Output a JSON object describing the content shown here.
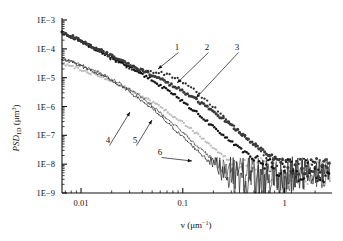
{
  "figure": {
    "background_color": "#ffffff",
    "plot_type": "log-log scatter/line power spectral density"
  },
  "axes": {
    "x": {
      "label_main": "v",
      "label_units": "(μm",
      "label_exponent": "−1",
      "label_close": ")",
      "label_full": "v (μm⁻¹)",
      "scale": "log",
      "range": [
        0.0065,
        2.8
      ],
      "tick_values": [
        0.01,
        0.1,
        1
      ],
      "tick_labels": [
        "0.01",
        "0.1",
        "1"
      ],
      "minor_ticks": true
    },
    "y": {
      "label_prefix": "PSD",
      "label_subscript": "1D",
      "label_units": "(μm",
      "label_exponent": "3",
      "label_close": ")",
      "label_full": "PSD₁ᴅ (μm³)",
      "scale": "log",
      "range": [
        1e-09,
        0.001
      ],
      "tick_values": [
        0.001,
        0.0001,
        1e-05,
        1e-06,
        1e-07,
        1e-08,
        1e-09
      ],
      "tick_labels": [
        "1E−3",
        "1E−4",
        "1E−5",
        "1E−6",
        "1E−7",
        "1E−8",
        "1E−9"
      ],
      "minor_ticks": true
    }
  },
  "annotations": [
    {
      "text": "1",
      "x": 177,
      "y": 50,
      "leader_to_x": 158,
      "leader_to_y": 69
    },
    {
      "text": "2",
      "x": 207,
      "y": 50,
      "leader_to_x": 177,
      "leader_to_y": 83
    },
    {
      "text": "3",
      "x": 237,
      "y": 50,
      "leader_to_x": 196,
      "leader_to_y": 98
    },
    {
      "text": "4",
      "x": 108,
      "y": 143,
      "leader_to_x": 130,
      "leader_to_y": 112
    },
    {
      "text": "5",
      "x": 135,
      "y": 143,
      "leader_to_x": 152,
      "leader_to_y": 120
    },
    {
      "text": "6",
      "x": 160,
      "y": 155,
      "leader_to_x": 192,
      "leader_to_y": 161
    }
  ],
  "chart_data": {
    "type": "line",
    "title": "",
    "xlabel": "v (μm⁻¹)",
    "ylabel": "PSD₁ᴅ (μm³)",
    "xscale": "log",
    "yscale": "log",
    "xlim": [
      0.0065,
      2.8
    ],
    "ylim": [
      1e-09,
      0.001
    ],
    "grid": false,
    "legend": "inline numeric callouts 1-6",
    "series": [
      {
        "name": "3",
        "label": "3",
        "color": "#3a3a3a",
        "style": "dense-dots-thick",
        "marker_size": 1.6,
        "x": [
          0.0068,
          0.009,
          0.012,
          0.016,
          0.021,
          0.028,
          0.037,
          0.05,
          0.066,
          0.088,
          0.117,
          0.155,
          0.206,
          0.274,
          0.364,
          0.484,
          0.643,
          0.855,
          1.14,
          1.51,
          2.0,
          2.4
        ],
        "y": [
          0.00036,
          0.00023,
          0.00014,
          8.5e-05,
          5.2e-05,
          3.2e-05,
          2e-05,
          1.25e-05,
          7.6e-06,
          4.4e-06,
          2.4e-06,
          1.25e-06,
          6.2e-07,
          2.9e-07,
          1.3e-07,
          5.6e-08,
          2.6e-08,
          1.4e-08,
          9e-09,
          7.5e-09,
          7e-09,
          7e-09
        ]
      },
      {
        "name": "2",
        "label": "2",
        "color": "#111111",
        "style": "dense-dots",
        "marker_size": 1.5,
        "x": [
          0.0068,
          0.009,
          0.012,
          0.016,
          0.021,
          0.028,
          0.037,
          0.05,
          0.066,
          0.088,
          0.117,
          0.155,
          0.206,
          0.274,
          0.364,
          0.484,
          0.643,
          0.855,
          1.14,
          1.51,
          2.0,
          2.4
        ],
        "y": [
          0.00035,
          0.00022,
          0.00013,
          7.8e-05,
          4.6e-05,
          2.7e-05,
          1.55e-05,
          8.4e-06,
          4.3e-06,
          2.1e-06,
          9.5e-07,
          4.2e-07,
          1.8e-07,
          7.6e-08,
          3.4e-08,
          1.7e-08,
          1e-08,
          7.5e-09,
          6.5e-09,
          6e-09,
          6e-09,
          6e-09
        ]
      },
      {
        "name": "1",
        "label": "1",
        "color": "#2b2b2b",
        "style": "sparse-dots",
        "marker_size": 1.4,
        "x": [
          0.0068,
          0.009,
          0.012,
          0.016,
          0.021,
          0.028,
          0.037,
          0.048,
          0.062,
          0.08,
          0.104,
          0.135,
          0.175,
          0.228,
          0.296,
          0.385,
          0.5,
          0.65,
          0.845,
          1.1,
          1.43,
          1.86,
          2.4
        ],
        "y": [
          0.00034,
          0.00021,
          0.000125,
          7.2e-05,
          4.1e-05,
          2.4e-05,
          1.75e-05,
          1.6e-05,
          1.45e-05,
          1.1e-05,
          6.5e-06,
          3.3e-06,
          1.5e-06,
          6.4e-07,
          2.6e-07,
          1.05e-07,
          4.4e-08,
          2e-08,
          1.1e-08,
          8e-09,
          7e-09,
          6.5e-09,
          6.5e-09
        ]
      },
      {
        "name": "4",
        "label": "4",
        "color": "#b8b8b8",
        "style": "dots-light",
        "marker_size": 1.4,
        "x": [
          0.0068,
          0.009,
          0.012,
          0.016,
          0.021,
          0.028,
          0.037,
          0.05,
          0.066,
          0.088,
          0.117,
          0.155,
          0.206,
          0.274,
          0.364,
          0.484,
          0.643,
          0.855,
          1.14,
          1.51,
          2.0,
          2.4
        ],
        "y": [
          3e-05,
          2.2e-05,
          1.55e-05,
          1.05e-05,
          7e-06,
          4.4e-06,
          2.6e-06,
          1.45e-06,
          7.6e-07,
          3.8e-07,
          1.8e-07,
          8e-08,
          3.5e-08,
          1.6e-08,
          8e-09,
          5e-09,
          4e-09,
          4e-09,
          4.5e-09,
          5e-09,
          5e-09,
          5e-09
        ]
      },
      {
        "name": "5",
        "label": "5",
        "color": "#4a4a4a",
        "style": "thin-line-dots",
        "marker_size": 1.0,
        "x": [
          0.0068,
          0.009,
          0.012,
          0.016,
          0.021,
          0.028,
          0.037,
          0.05,
          0.066,
          0.088,
          0.117,
          0.155,
          0.206,
          0.274,
          0.364,
          0.484,
          0.643,
          0.855,
          1.14,
          1.51,
          2.0,
          2.4
        ],
        "y": [
          4.6e-05,
          3.2e-05,
          2.1e-05,
          1.35e-05,
          8.2e-06,
          4.6e-06,
          2.4e-06,
          1.1e-06,
          4.6e-07,
          1.9e-07,
          7.6e-08,
          3e-08,
          1.3e-08,
          6.5e-09,
          4e-09,
          3.2e-09,
          3e-09,
          3.2e-09,
          4e-09,
          4.5e-09,
          5e-09,
          5e-09
        ]
      },
      {
        "name": "6",
        "label": "6",
        "color": "#2a2a2a",
        "style": "thin-line-noisy",
        "marker_size": 0.9,
        "x": [
          0.0068,
          0.009,
          0.012,
          0.016,
          0.021,
          0.028,
          0.037,
          0.05,
          0.066,
          0.088,
          0.117,
          0.155,
          0.206,
          0.274,
          0.364,
          0.484,
          0.643,
          0.855,
          1.14,
          1.51,
          2.0,
          2.4
        ],
        "y": [
          4.4e-05,
          3e-05,
          1.95e-05,
          1.2e-05,
          7e-06,
          3.8e-06,
          1.9e-06,
          8.4e-07,
          3.4e-07,
          1.35e-07,
          5.2e-08,
          2.1e-08,
          9.5e-09,
          5e-09,
          3.4e-09,
          2.8e-09,
          2.8e-09,
          3.2e-09,
          4e-09,
          4.5e-09,
          5e-09,
          5e-09
        ]
      }
    ]
  }
}
